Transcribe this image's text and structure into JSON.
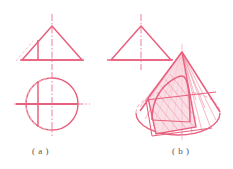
{
  "figure": {
    "kind": "engineering-drawing",
    "line_color": "#e8607e",
    "line_color_dark": "#d94a6a",
    "line_color_light": "#f0a8b8",
    "fill_color": "#f8d6de",
    "caption_color": "#555555",
    "background": "#ffffff"
  },
  "captions": {
    "a": "( a )",
    "b": "( b )"
  },
  "part_a": {
    "label": "( a )",
    "description": "Three-view orthographic projection of the cut cone",
    "views": [
      {
        "name": "front-view-triangle",
        "shape": "isosceles triangle",
        "apex": {
          "x": 52,
          "y": 26
        },
        "base_left": {
          "x": 22,
          "y": 60
        },
        "base_right": {
          "x": 82,
          "y": 60
        },
        "center_line": "vertical dash-dot through apex",
        "cut_line": "solid vertical line left of axis",
        "hidden_line": "dashed diagonal at lower left"
      },
      {
        "name": "side-view-triangle",
        "shape": "isosceles triangle",
        "apex": {
          "x": 141,
          "y": 26
        },
        "base_left": {
          "x": 111,
          "y": 60
        },
        "base_right": {
          "x": 171,
          "y": 60
        },
        "center_line": "vertical dash-dot through apex"
      },
      {
        "name": "top-view-circle",
        "shape": "circle",
        "center": {
          "x": 52,
          "y": 104
        },
        "radius": 26,
        "center_lines": "horizontal and vertical dash-dot",
        "cut_line": "solid vertical chord left of center"
      }
    ]
  },
  "part_b": {
    "label": "( b )",
    "description": "Axonometric (pictorial) view of the cone cut by a frontal plane producing a hyperbolic section",
    "elements": [
      {
        "name": "cone-apex",
        "x": 182,
        "y": 52
      },
      {
        "name": "base-ellipse",
        "cx": 178,
        "cy": 113,
        "rx": 42,
        "ry": 22,
        "note": "front half solid, rear half dashed"
      },
      {
        "name": "cutting-plane",
        "note": "shaded quadrilateral, fill #f8d6de"
      },
      {
        "name": "section-curve",
        "note": "hyperbola arc on cut face"
      },
      {
        "name": "ruling-lines",
        "count": 14,
        "note": "generatrices from apex to base ellipse"
      },
      {
        "name": "axis-line",
        "note": "vertical dash-dot through apex and base centre"
      }
    ]
  }
}
